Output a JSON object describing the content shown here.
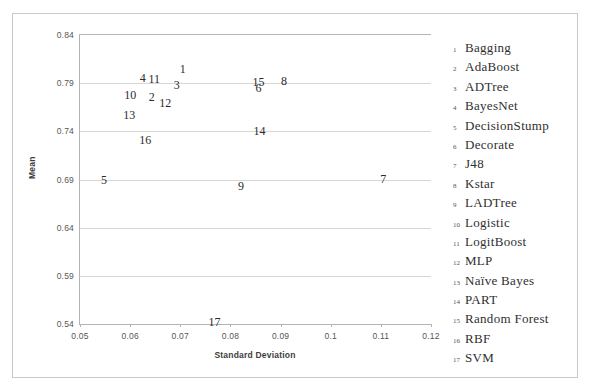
{
  "chart_data": {
    "type": "scatter",
    "title": "",
    "xlabel": "Standard Deviation",
    "ylabel": "Mean",
    "xlim": [
      0.05,
      0.12
    ],
    "ylim": [
      0.54,
      0.84
    ],
    "xticks": [
      "0.05",
      "0.06",
      "0.07",
      "0.08",
      "0.09",
      "0.1",
      "0.11",
      "0.12"
    ],
    "xtick_values": [
      0.05,
      0.06,
      0.07,
      0.08,
      0.09,
      0.1,
      0.11,
      0.12
    ],
    "yticks": [
      "0.84",
      "0.79",
      "0.74",
      "0.69",
      "0.64",
      "0.59",
      "0.54"
    ],
    "ytick_values": [
      0.84,
      0.79,
      0.74,
      0.69,
      0.64,
      0.59,
      0.54
    ],
    "grid": true,
    "legend_position": "right",
    "marker_style": "numeric-label",
    "points": [
      {
        "label": "1",
        "name": "Bagging",
        "x": 0.0705,
        "y": 0.8045
      },
      {
        "label": "2",
        "name": "AdaBoost",
        "x": 0.0643,
        "y": 0.776
      },
      {
        "label": "3",
        "name": "ADTree",
        "x": 0.0693,
        "y": 0.7885
      },
      {
        "label": "4",
        "name": "BayesNet",
        "x": 0.0625,
        "y": 0.7958
      },
      {
        "label": "5",
        "name": "DecisionStump",
        "x": 0.0548,
        "y": 0.69
      },
      {
        "label": "6",
        "name": "Decorate",
        "x": 0.0856,
        "y": 0.7855
      },
      {
        "label": "7",
        "name": "J48",
        "x": 0.1105,
        "y": 0.6905
      },
      {
        "label": "8",
        "name": "Kstar",
        "x": 0.0907,
        "y": 0.7925
      },
      {
        "label": "9",
        "name": "LADTree",
        "x": 0.0821,
        "y": 0.6835
      },
      {
        "label": "10",
        "name": "Logistic",
        "x": 0.06,
        "y": 0.778
      },
      {
        "label": "11",
        "name": "LogitBoost",
        "x": 0.0648,
        "y": 0.794
      },
      {
        "label": "12",
        "name": "MLP",
        "x": 0.067,
        "y": 0.769
      },
      {
        "label": "13",
        "name": "Naïve Bayes",
        "x": 0.0598,
        "y": 0.7565
      },
      {
        "label": "14",
        "name": "PART",
        "x": 0.0858,
        "y": 0.74
      },
      {
        "label": "15",
        "name": "Random Forest",
        "x": 0.0856,
        "y": 0.791
      },
      {
        "label": "16",
        "name": "RBF",
        "x": 0.063,
        "y": 0.731
      },
      {
        "label": "17",
        "name": "SVM",
        "x": 0.0768,
        "y": 0.5425
      }
    ]
  },
  "legend": {
    "items": [
      {
        "index": "1",
        "label": "Bagging"
      },
      {
        "index": "2",
        "label": "AdaBoost"
      },
      {
        "index": "3",
        "label": "ADTree"
      },
      {
        "index": "4",
        "label": "BayesNet"
      },
      {
        "index": "5",
        "label": "DecisionStump"
      },
      {
        "index": "6",
        "label": "Decorate"
      },
      {
        "index": "7",
        "label": "J48"
      },
      {
        "index": "8",
        "label": "Kstar"
      },
      {
        "index": "9",
        "label": "LADTree"
      },
      {
        "index": "10",
        "label": "Logistic"
      },
      {
        "index": "11",
        "label": "LogitBoost"
      },
      {
        "index": "12",
        "label": "MLP"
      },
      {
        "index": "13",
        "label": "Naïve Bayes"
      },
      {
        "index": "14",
        "label": "PART"
      },
      {
        "index": "15",
        "label": "Random Forest"
      },
      {
        "index": "16",
        "label": "RBF"
      },
      {
        "index": "17",
        "label": "SVM"
      }
    ]
  },
  "colors": {
    "frame": "#c9c9c9",
    "axis": "#b4b4b4",
    "grid": "#d7d7d7",
    "tick_text": "#555555",
    "point_text": "#2b2b2b",
    "legend_text": "#2f2f2f",
    "background": "#ffffff"
  }
}
